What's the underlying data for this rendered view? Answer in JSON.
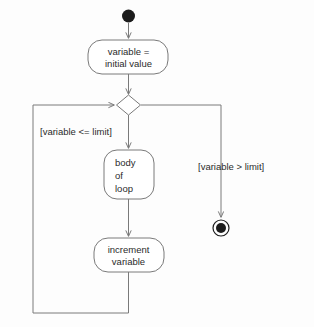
{
  "diagram": {
    "type": "uml-activity-diagram",
    "background_color": "#fdfdfd",
    "line_color": "#7a7a7a",
    "text_color": "#2b2b2b",
    "node_fill": "#ffffff",
    "marker_color": "#1c1c1c"
  },
  "nodes": {
    "start": {
      "name": "initial-node",
      "shape": "filled-circle",
      "cx": 128,
      "cy": 16,
      "r": 6.5
    },
    "init_action": {
      "name": "initialize-variable-action",
      "shape": "rounded-rectangle",
      "x": 88,
      "y": 40,
      "width": 80,
      "height": 34,
      "rx": 14,
      "line1": "variable =",
      "line2": "initial value",
      "align": "center"
    },
    "decision": {
      "name": "loop-condition-decision",
      "shape": "diamond",
      "cx": 128.5,
      "cy": 105,
      "half_width": 12,
      "half_height": 10
    },
    "body_action": {
      "name": "loop-body-action",
      "shape": "rounded-rectangle",
      "x": 104,
      "y": 150,
      "width": 50,
      "height": 49,
      "rx": 13,
      "line1": "body",
      "line2": "of",
      "line3": "loop",
      "align": "left"
    },
    "increment_action": {
      "name": "increment-variable-action",
      "shape": "rounded-rectangle",
      "x": 94,
      "y": 238,
      "width": 70,
      "height": 34,
      "rx": 14,
      "line1": "increment",
      "line2": "variable",
      "align": "center"
    },
    "end": {
      "name": "final-node",
      "shape": "bullseye",
      "cx": 221,
      "cy": 228,
      "outer_r": 8,
      "inner_r": 5
    }
  },
  "guards": {
    "loop_continue": {
      "name": "guard-loop-continue",
      "label": "[variable <= limit]",
      "x": 40,
      "y": 135
    },
    "loop_exit": {
      "name": "guard-loop-exit",
      "label": "[variable > limit]",
      "x": 198,
      "y": 170
    }
  },
  "edges": [
    {
      "name": "edge-start-to-init",
      "from": "start",
      "to": "init_action",
      "path": "M 128.5 23 L 128.5 38",
      "arrow": true
    },
    {
      "name": "edge-init-to-decision",
      "from": "init_action",
      "to": "decision",
      "path": "M 128.5 74 L 128.5 94",
      "arrow": true
    },
    {
      "name": "edge-decision-to-body",
      "from": "decision",
      "to": "body_action",
      "path": "M 128.5 115 L 128.5 148",
      "arrow": true
    },
    {
      "name": "edge-body-to-increment",
      "from": "body_action",
      "to": "increment_action",
      "path": "M 128.5 199 L 128.5 236",
      "arrow": true
    },
    {
      "name": "edge-increment-loopback",
      "from": "increment_action",
      "to": "decision",
      "path": "M 128.5 272 L 128.5 313 L 33 313 L 33 105 L 114 105",
      "arrow": true
    },
    {
      "name": "edge-decision-to-end",
      "from": "decision",
      "to": "end",
      "path": "M 141 105 L 221 105 L 221 217",
      "arrow": true
    }
  ]
}
